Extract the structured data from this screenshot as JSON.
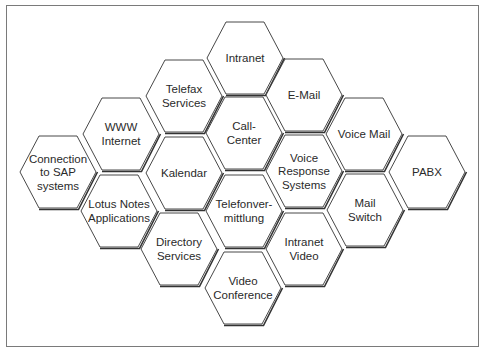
{
  "diagram": {
    "type": "hexagon-cluster",
    "hexagons": [
      {
        "id": "intranet",
        "lines": [
          "Intranet"
        ],
        "cx": 245,
        "cy": 58
      },
      {
        "id": "telefax-services",
        "lines": [
          "Telefax",
          "Services"
        ],
        "cx": 184,
        "cy": 96
      },
      {
        "id": "e-mail",
        "lines": [
          "E-Mail"
        ],
        "cx": 304,
        "cy": 95
      },
      {
        "id": "www-internet",
        "lines": [
          "WWW",
          "Internet"
        ],
        "cx": 121,
        "cy": 134
      },
      {
        "id": "call-center",
        "lines": [
          "Call-",
          "Center"
        ],
        "cx": 244,
        "cy": 133
      },
      {
        "id": "voice-mail",
        "lines": [
          "Voice Mail"
        ],
        "cx": 364,
        "cy": 134
      },
      {
        "id": "connection-to-sap",
        "lines": [
          "Connection",
          "to SAP",
          "systems"
        ],
        "cx": 58,
        "cy": 172
      },
      {
        "id": "kalendar",
        "lines": [
          "Kalendar"
        ],
        "cx": 184,
        "cy": 173
      },
      {
        "id": "voice-response-systems",
        "lines": [
          "Voice",
          "Response",
          "Systems"
        ],
        "cx": 304,
        "cy": 171
      },
      {
        "id": "pabx",
        "lines": [
          "PABX"
        ],
        "cx": 427,
        "cy": 172
      },
      {
        "id": "lotus-notes-applications",
        "lines": [
          "Lotus Notes",
          "Applications"
        ],
        "cx": 119,
        "cy": 211
      },
      {
        "id": "telefonvermittlung",
        "lines": [
          "Telefonver-",
          "mittlung"
        ],
        "cx": 244,
        "cy": 211
      },
      {
        "id": "mail-switch",
        "lines": [
          "Mail",
          "Switch"
        ],
        "cx": 365,
        "cy": 210
      },
      {
        "id": "directory-services",
        "lines": [
          "Directory",
          "Services"
        ],
        "cx": 179,
        "cy": 249
      },
      {
        "id": "intranet-video",
        "lines": [
          "Intranet",
          "Video"
        ],
        "cx": 304,
        "cy": 249
      },
      {
        "id": "video-conference",
        "lines": [
          "Video",
          "Conference"
        ],
        "cx": 243,
        "cy": 288
      }
    ],
    "colors": {
      "stroke": "#333333",
      "fill": "#ffffff",
      "text": "#2a2a2a",
      "frame": "#7a7a7a"
    }
  }
}
